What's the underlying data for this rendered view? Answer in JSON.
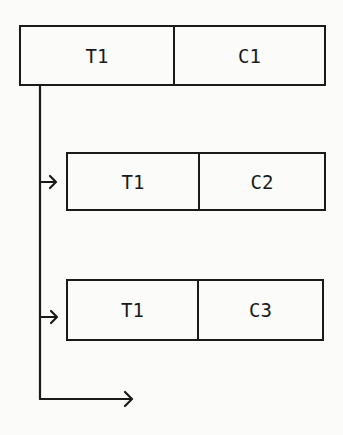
{
  "diagram": {
    "records": [
      {
        "id": "root",
        "fields": [
          "T1",
          "C1"
        ]
      },
      {
        "id": "child-1",
        "fields": [
          "T1",
          "C2"
        ]
      },
      {
        "id": "child-2",
        "fields": [
          "T1",
          "C3"
        ]
      }
    ],
    "connections": [
      {
        "from": "root",
        "to": "child-1",
        "type": "arrow"
      },
      {
        "from": "root",
        "to": "child-2",
        "type": "arrow"
      },
      {
        "from": "root",
        "to": "continuation",
        "type": "arrow"
      }
    ],
    "colors": {
      "line": "#1a1a1a",
      "background": "#fbfbf9"
    }
  }
}
